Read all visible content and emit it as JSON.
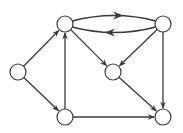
{
  "diagram": {
    "type": "directed-graph",
    "background": "#ffffff",
    "stroke_color": "#3a3a3a",
    "node_fill": "#ffffff",
    "node_radius": 8,
    "nodes": [
      {
        "id": "A",
        "x": 18,
        "y": 72
      },
      {
        "id": "B",
        "x": 65,
        "y": 24
      },
      {
        "id": "C",
        "x": 163,
        "y": 24
      },
      {
        "id": "D",
        "x": 113,
        "y": 72
      },
      {
        "id": "E",
        "x": 65,
        "y": 117
      },
      {
        "id": "F",
        "x": 163,
        "y": 117
      }
    ],
    "edges": [
      {
        "from": "A",
        "to": "B"
      },
      {
        "from": "A",
        "to": "E"
      },
      {
        "from": "E",
        "to": "B"
      },
      {
        "from": "B",
        "to": "C",
        "curve": "upper"
      },
      {
        "from": "C",
        "to": "B",
        "curve": "lower"
      },
      {
        "from": "B",
        "to": "D"
      },
      {
        "from": "C",
        "to": "D"
      },
      {
        "from": "C",
        "to": "F"
      },
      {
        "from": "D",
        "to": "F"
      },
      {
        "from": "E",
        "to": "F"
      }
    ]
  }
}
